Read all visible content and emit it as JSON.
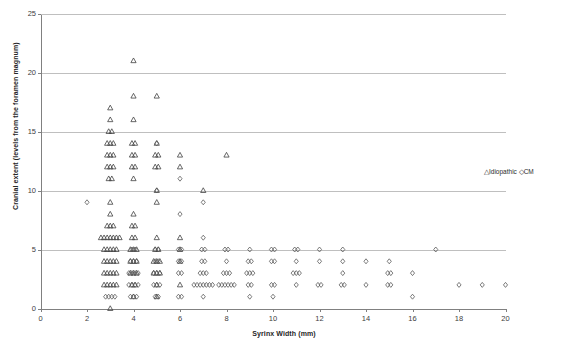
{
  "chart_data": {
    "type": "scatter",
    "title": "",
    "xlabel": "Syrinx Width (mm)",
    "ylabel": "Cranial extent (levels from the foramen magnum)",
    "xlim": [
      0,
      20
    ],
    "ylim": [
      0,
      25
    ],
    "xticks": [
      0,
      2,
      4,
      6,
      8,
      10,
      12,
      14,
      16,
      18,
      20
    ],
    "yticks": [
      0,
      5,
      10,
      15,
      20,
      25
    ],
    "grid": "horizontal",
    "legend_position": "right",
    "series": [
      {
        "name": "Idiopathic",
        "marker": "triangle",
        "color": "#404040",
        "points": [
          [
            3,
            0
          ],
          [
            3,
            2
          ],
          [
            3,
            2
          ],
          [
            3,
            2
          ],
          [
            3,
            2
          ],
          [
            3,
            2
          ],
          [
            3,
            3
          ],
          [
            3,
            3
          ],
          [
            3,
            3
          ],
          [
            3,
            3
          ],
          [
            3,
            3
          ],
          [
            3,
            4
          ],
          [
            3,
            4
          ],
          [
            3,
            4
          ],
          [
            3,
            4
          ],
          [
            3,
            4
          ],
          [
            3,
            5
          ],
          [
            3,
            5
          ],
          [
            3,
            5
          ],
          [
            3,
            5
          ],
          [
            3,
            5
          ],
          [
            3,
            6
          ],
          [
            3,
            6
          ],
          [
            3,
            6
          ],
          [
            3,
            6
          ],
          [
            3,
            6
          ],
          [
            3,
            6
          ],
          [
            3,
            6
          ],
          [
            3,
            7
          ],
          [
            3,
            7
          ],
          [
            3,
            7
          ],
          [
            3,
            8
          ],
          [
            3,
            9
          ],
          [
            3,
            11
          ],
          [
            3,
            11
          ],
          [
            3,
            12
          ],
          [
            3,
            12
          ],
          [
            3,
            12
          ],
          [
            3,
            13
          ],
          [
            3,
            13
          ],
          [
            3,
            13
          ],
          [
            3,
            14
          ],
          [
            3,
            14
          ],
          [
            3,
            14
          ],
          [
            3,
            15
          ],
          [
            3,
            15
          ],
          [
            3,
            16
          ],
          [
            3,
            17
          ],
          [
            4,
            1
          ],
          [
            4,
            2
          ],
          [
            4,
            2
          ],
          [
            4,
            3
          ],
          [
            4,
            3
          ],
          [
            4,
            3
          ],
          [
            4,
            4
          ],
          [
            4,
            4
          ],
          [
            4,
            4
          ],
          [
            4,
            5
          ],
          [
            4,
            5
          ],
          [
            4,
            5
          ],
          [
            4,
            6
          ],
          [
            4,
            6
          ],
          [
            4,
            7
          ],
          [
            4,
            7
          ],
          [
            4,
            8
          ],
          [
            4,
            11
          ],
          [
            4,
            12
          ],
          [
            4,
            12
          ],
          [
            4,
            13
          ],
          [
            4,
            13
          ],
          [
            4,
            14
          ],
          [
            4,
            14
          ],
          [
            4,
            16
          ],
          [
            4,
            18
          ],
          [
            4,
            21
          ],
          [
            5,
            1
          ],
          [
            5,
            2
          ],
          [
            5,
            3
          ],
          [
            5,
            3
          ],
          [
            5,
            3
          ],
          [
            5,
            4
          ],
          [
            5,
            4
          ],
          [
            5,
            4
          ],
          [
            5,
            5
          ],
          [
            5,
            5
          ],
          [
            5,
            6
          ],
          [
            5,
            9
          ],
          [
            5,
            10
          ],
          [
            5,
            12
          ],
          [
            5,
            12
          ],
          [
            5,
            13
          ],
          [
            5,
            13
          ],
          [
            5,
            14
          ],
          [
            5,
            18
          ],
          [
            6,
            2
          ],
          [
            6,
            4
          ],
          [
            6,
            5
          ],
          [
            6,
            6
          ],
          [
            6,
            12
          ],
          [
            6,
            13
          ],
          [
            7,
            10
          ],
          [
            8,
            13
          ]
        ]
      },
      {
        "name": "CM",
        "marker": "diamond",
        "color": "#595959",
        "points": [
          [
            2,
            9
          ],
          [
            3,
            1
          ],
          [
            3,
            1
          ],
          [
            3,
            1
          ],
          [
            3,
            1
          ],
          [
            4,
            1
          ],
          [
            4,
            1
          ],
          [
            4,
            1
          ],
          [
            4,
            2
          ],
          [
            4,
            2
          ],
          [
            4,
            2
          ],
          [
            4,
            2
          ],
          [
            4,
            3
          ],
          [
            4,
            3
          ],
          [
            4,
            3
          ],
          [
            4,
            3
          ],
          [
            4,
            4
          ],
          [
            4,
            4
          ],
          [
            4,
            4
          ],
          [
            4,
            5
          ],
          [
            4,
            5
          ],
          [
            5,
            1
          ],
          [
            5,
            1
          ],
          [
            5,
            2
          ],
          [
            5,
            2
          ],
          [
            5,
            2
          ],
          [
            5,
            3
          ],
          [
            5,
            3
          ],
          [
            5,
            3
          ],
          [
            5,
            4
          ],
          [
            5,
            4
          ],
          [
            5,
            5
          ],
          [
            5,
            5
          ],
          [
            5,
            10
          ],
          [
            5,
            14
          ],
          [
            6,
            1
          ],
          [
            6,
            1
          ],
          [
            6,
            3
          ],
          [
            6,
            3
          ],
          [
            6,
            4
          ],
          [
            6,
            4
          ],
          [
            6,
            5
          ],
          [
            6,
            5
          ],
          [
            6,
            8
          ],
          [
            6,
            11
          ],
          [
            7,
            1
          ],
          [
            7,
            2
          ],
          [
            7,
            2
          ],
          [
            7,
            2
          ],
          [
            7,
            2
          ],
          [
            7,
            2
          ],
          [
            7,
            2
          ],
          [
            7,
            2
          ],
          [
            7,
            3
          ],
          [
            7,
            3
          ],
          [
            7,
            3
          ],
          [
            7,
            4
          ],
          [
            7,
            4
          ],
          [
            7,
            5
          ],
          [
            7,
            5
          ],
          [
            7,
            6
          ],
          [
            7,
            9
          ],
          [
            8,
            2
          ],
          [
            8,
            2
          ],
          [
            8,
            2
          ],
          [
            8,
            2
          ],
          [
            8,
            2
          ],
          [
            8,
            2
          ],
          [
            8,
            3
          ],
          [
            8,
            3
          ],
          [
            8,
            3
          ],
          [
            8,
            4
          ],
          [
            8,
            5
          ],
          [
            8,
            5
          ],
          [
            9,
            1
          ],
          [
            9,
            2
          ],
          [
            9,
            2
          ],
          [
            9,
            3
          ],
          [
            9,
            3
          ],
          [
            9,
            3
          ],
          [
            9,
            4
          ],
          [
            9,
            4
          ],
          [
            9,
            5
          ],
          [
            10,
            1
          ],
          [
            10,
            2
          ],
          [
            10,
            2
          ],
          [
            10,
            4
          ],
          [
            10,
            4
          ],
          [
            10,
            5
          ],
          [
            10,
            5
          ],
          [
            11,
            2
          ],
          [
            11,
            3
          ],
          [
            11,
            3
          ],
          [
            11,
            3
          ],
          [
            11,
            4
          ],
          [
            11,
            5
          ],
          [
            11,
            5
          ],
          [
            12,
            2
          ],
          [
            12,
            2
          ],
          [
            12,
            4
          ],
          [
            12,
            5
          ],
          [
            13,
            2
          ],
          [
            13,
            2
          ],
          [
            13,
            3
          ],
          [
            13,
            4
          ],
          [
            13,
            5
          ],
          [
            14,
            2
          ],
          [
            14,
            4
          ],
          [
            15,
            2
          ],
          [
            15,
            2
          ],
          [
            15,
            3
          ],
          [
            15,
            3
          ],
          [
            15,
            4
          ],
          [
            16,
            1
          ],
          [
            16,
            3
          ],
          [
            17,
            5
          ],
          [
            18,
            2
          ],
          [
            19,
            2
          ],
          [
            20,
            2
          ]
        ]
      }
    ]
  },
  "legend": {
    "idiopathic_glyph": "△",
    "idiopathic_label": "Idiopathic",
    "cm_glyph": "◇",
    "cm_label": "CM"
  },
  "axes": {
    "x_title": "Syrinx Width (mm)",
    "y_title": "Cranial extent (levels from the foramen magnum)",
    "x_tick_labels": [
      "0",
      "2",
      "4",
      "6",
      "8",
      "10",
      "12",
      "14",
      "16",
      "18",
      "20"
    ],
    "y_tick_labels": [
      "0",
      "5",
      "10",
      "15",
      "20",
      "25"
    ]
  },
  "colors": {
    "axis": "#808080",
    "grid": "#bfbfbf",
    "marker": "#4d4d4d",
    "text": "#262626",
    "background": "#ffffff"
  }
}
